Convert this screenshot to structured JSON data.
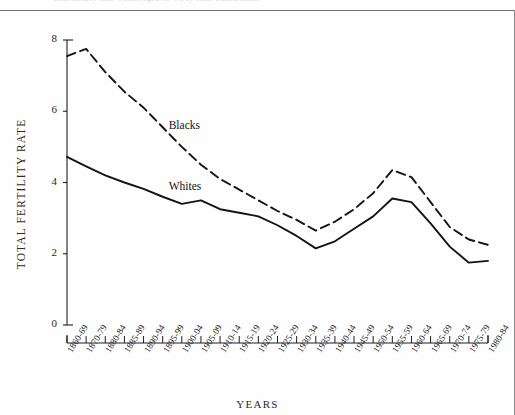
{
  "figure": {
    "caption_remnant": "Total fertility rate, women aged 15-44, by race, United States",
    "xlabel": "YEARS",
    "ylabel": "TOTAL FERTILITY RATE"
  },
  "chart_data": {
    "type": "line",
    "title": "",
    "xlabel": "YEARS",
    "ylabel": "TOTAL FERTILITY RATE",
    "ylim": [
      0,
      8
    ],
    "yticks": [
      0,
      2,
      4,
      6,
      8
    ],
    "grid": false,
    "legend_position": "inline-annotation",
    "categories": [
      "1860-69",
      "1870-79",
      "1880-84",
      "1885-89",
      "1890-94",
      "1895-99",
      "1900-04",
      "1905-09",
      "1910-14",
      "1915-19",
      "1920-24",
      "1925-29",
      "1930-34",
      "1935-39",
      "1940-44",
      "1945-49",
      "1950-54",
      "1955-59",
      "1960-64",
      "1965-69",
      "1970-74",
      "1975-79",
      "1980-84"
    ],
    "series": [
      {
        "name": "Blacks",
        "style": "dashed",
        "color": "#141414",
        "values": [
          7.55,
          7.75,
          7.1,
          6.55,
          6.1,
          5.55,
          5.0,
          4.5,
          4.1,
          3.8,
          3.5,
          3.2,
          2.95,
          2.65,
          2.9,
          3.25,
          3.7,
          4.35,
          4.15,
          3.45,
          2.75,
          2.4,
          2.25
        ]
      },
      {
        "name": "Whites",
        "style": "solid",
        "color": "#141414",
        "values": [
          4.72,
          4.45,
          4.2,
          4.0,
          3.82,
          3.6,
          3.4,
          3.5,
          3.25,
          3.15,
          3.05,
          2.8,
          2.5,
          2.15,
          2.35,
          2.7,
          3.05,
          3.55,
          3.45,
          2.85,
          2.2,
          1.75,
          1.8
        ]
      }
    ],
    "annotations": [
      {
        "text": "Blacks",
        "category": "1895-99",
        "value": 5.55
      },
      {
        "text": "Whites",
        "category": "1895-99",
        "value": 3.85
      }
    ]
  }
}
